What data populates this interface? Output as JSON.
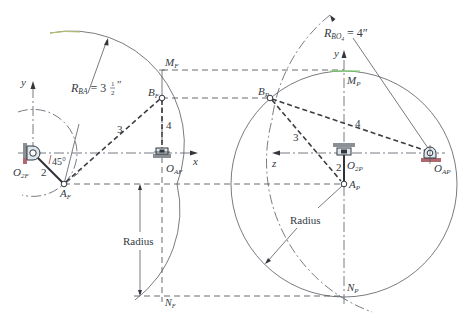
{
  "diagram": {
    "front_view": {
      "labels": {
        "y_axis": "y",
        "x_axis": "x",
        "ground_pivot": "O",
        "ground_pivot_sub": "2F",
        "crank_end": "A",
        "crank_end_sub": "F",
        "coupler_end": "B",
        "coupler_end_sub": "F",
        "slider_pivot": "O",
        "slider_pivot_sub": "AF",
        "top_point": "M",
        "top_point_sub": "F",
        "bottom_point": "N",
        "bottom_point_sub": "F",
        "link_2": "2",
        "link_3": "3",
        "link_4": "4",
        "angle": "45°",
        "radius_label_prefix": "R",
        "radius_label_sub": "BA",
        "radius_label_value": " = 3",
        "radius_label_frac_num": "1",
        "radius_label_frac_den": "2",
        "radius_label_unit": "″",
        "radius_dimension": "Radius"
      }
    },
    "profile_view": {
      "labels": {
        "y_axis": "y",
        "z_axis": "z",
        "ground_pivot": "O",
        "ground_pivot_sub": "2P",
        "crank_end": "A",
        "crank_end_sub": "P",
        "coupler_end": "B",
        "coupler_end_sub": "P",
        "slider_pivot": "O",
        "slider_pivot_sub": "AP",
        "top_point": "M",
        "top_point_sub": "P",
        "bottom_point": "N",
        "bottom_point_sub": "P",
        "link_2": "2",
        "link_3": "3",
        "link_4": "4",
        "radius_label_prefix": "R",
        "radius_label_sub": "BO",
        "radius_label_sub2": "4",
        "radius_label_value": " = 4″",
        "radius_dimension": "Radius"
      }
    },
    "colors": {
      "line": "#55595f",
      "link": "#2e3136",
      "text": "#333a44",
      "ground_hatch": "#8a8f96",
      "ground_red": "#b06870",
      "highlight_green": "#7fd36b"
    }
  }
}
